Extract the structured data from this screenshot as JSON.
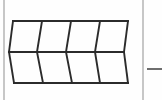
{
  "figure": {
    "title": "Tessellation of eight congruent quadrilaterals",
    "type": "geometric-diagram",
    "background_color": "#fefefe",
    "stroke_color": "#2b2b2b",
    "rule_color": "#b9b9b9",
    "grid": {
      "rows": 2,
      "columns": 4,
      "cell_count": 8,
      "cell_shape": "quadrilateral"
    },
    "horizontal_lines": [
      {
        "name": "top-edge",
        "y": 21,
        "x_start": 13,
        "x_end": 128
      },
      {
        "name": "middle-edge",
        "y": 52,
        "x_start": 9,
        "x_end": 124
      },
      {
        "name": "bottom-edge",
        "y": 83,
        "x_start": 14,
        "x_end": 128
      }
    ],
    "top_row_divider_x": [
      13,
      42,
      71,
      100,
      128
    ],
    "middle_row_divider_x": [
      9,
      37,
      66,
      95,
      124
    ],
    "bottom_row_divider_x": [
      14,
      43,
      72,
      100,
      128
    ],
    "page_rules": [
      {
        "name": "left-margin-rule",
        "x": 4,
        "y_start": 0,
        "y_end": 100
      },
      {
        "name": "right-margin-rule",
        "x": 143,
        "y_start": 0,
        "y_end": 100
      }
    ],
    "margin_dash": {
      "name": "margin-dash-mark",
      "x_start": 147,
      "x_end": 162,
      "y": 69
    }
  }
}
